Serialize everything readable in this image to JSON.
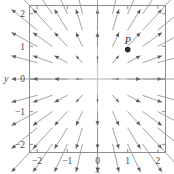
{
  "chart_data": {
    "type": "scatter",
    "title": "",
    "subtitle": "",
    "xlabel": "x",
    "ylabel": "y",
    "xlim": [
      -2.25,
      2.25
    ],
    "ylim": [
      -2.25,
      2.25
    ],
    "grid": false,
    "legend": null,
    "x_ticks": [
      -2,
      -1,
      0,
      1,
      2
    ],
    "x_tick_labels": [
      "-2",
      "-1",
      "0",
      "1",
      "2"
    ],
    "y_ticks": [
      -2,
      -1,
      0,
      1,
      2
    ],
    "y_tick_labels": [
      "-2",
      "-1",
      "0",
      "1",
      "2"
    ],
    "annotations": [
      {
        "label": "P",
        "x": 1.0,
        "y": 0.9
      }
    ],
    "points": [
      {
        "name": "P",
        "x": 1.0,
        "y": 0.9,
        "marker": "filled-circle"
      }
    ],
    "vector_field": {
      "description": "direction field of arrows; arrows point away from the origin along the radial direction, length grows with distance from origin",
      "grid_x": [
        -2.0,
        -1.5,
        -1.0,
        -0.5,
        0.0,
        0.5,
        1.0,
        1.5,
        2.0
      ],
      "grid_y": [
        -2.0,
        -1.5,
        -1.0,
        -0.5,
        0.0,
        0.5,
        1.0,
        1.5,
        2.0
      ],
      "u_formula": "x",
      "v_formula": "y",
      "scale": 0.42,
      "color": "#8a8a8a",
      "head_color": "#5a5a5a"
    }
  },
  "axes": {
    "x_axis_label": "x",
    "y_axis_label": "y",
    "frame_color": "#8c8c8c",
    "axis_line_color": "#c9c9c9"
  },
  "colors": {
    "background": "#ffffff",
    "text": "#4a4a4a",
    "point": "#2b2b2b",
    "arrow": "#8a8a8a"
  }
}
